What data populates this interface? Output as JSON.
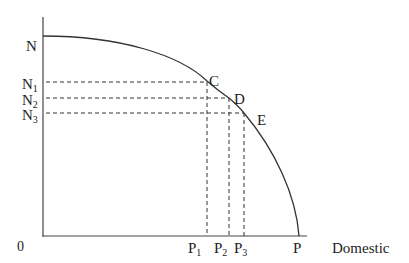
{
  "diagram": {
    "axes": {
      "origin_label": "0",
      "y_axis_top_label": "N",
      "x_axis_end_label": "P",
      "x_axis_title": "Domestic"
    },
    "y_levels": [
      {
        "id": "N1",
        "base": "N",
        "sub": "1"
      },
      {
        "id": "N2",
        "base": "N",
        "sub": "2"
      },
      {
        "id": "N3",
        "base": "N",
        "sub": "3"
      }
    ],
    "x_levels": [
      {
        "id": "P1",
        "base": "P",
        "sub": "1"
      },
      {
        "id": "P2",
        "base": "P",
        "sub": "2"
      },
      {
        "id": "P3",
        "base": "P",
        "sub": "3"
      }
    ],
    "points": [
      {
        "label": "C"
      },
      {
        "label": "D"
      },
      {
        "label": "E"
      }
    ],
    "colors": {
      "line": "#333333",
      "text": "#222222",
      "background": "#ffffff"
    }
  }
}
